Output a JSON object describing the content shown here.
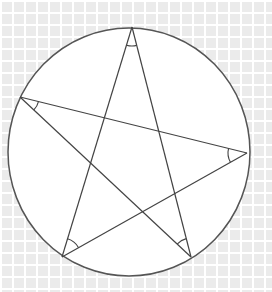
{
  "figure": {
    "background": {
      "tile_color": "#ebebeb",
      "grid_line_color": "#ffffff"
    },
    "circle": {
      "cx": 129,
      "cy": 152,
      "rx": 121,
      "ry": 124,
      "fill": "#ffffff",
      "stroke": "#555555"
    },
    "vertices": {
      "A_top": [
        132,
        27
      ],
      "B_left": [
        20,
        97
      ],
      "C_right": [
        247,
        153
      ],
      "D_bottom_left": [
        62,
        257
      ],
      "E_bottom_right": [
        191,
        257
      ]
    },
    "star_edges": [
      [
        "A_top",
        "D_bottom_left"
      ],
      [
        "A_top",
        "E_bottom_right"
      ],
      [
        "B_left",
        "C_right"
      ],
      [
        "B_left",
        "E_bottom_right"
      ],
      [
        "C_right",
        "D_bottom_left"
      ]
    ],
    "angle_marks": [
      {
        "at": "A_top",
        "radius": 19
      },
      {
        "at": "B_left",
        "radius": 19
      },
      {
        "at": "C_right",
        "radius": 19
      },
      {
        "at": "D_bottom_left",
        "radius": 19
      },
      {
        "at": "E_bottom_right",
        "radius": 19
      }
    ],
    "line_color": "#444444"
  }
}
